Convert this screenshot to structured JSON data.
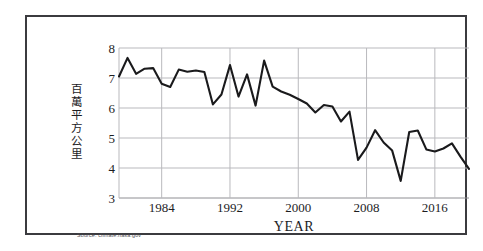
{
  "figure": {
    "source_note": "Source: climate.nasa.gov"
  },
  "chart_data": {
    "type": "line",
    "title": "",
    "xlabel": "YEAR",
    "ylabel": "百萬平方公里",
    "xlim": [
      1979,
      2020
    ],
    "ylim": [
      3,
      8
    ],
    "xticks": [
      1984,
      1992,
      2000,
      2008,
      2016
    ],
    "yticks": [
      3,
      4,
      5,
      6,
      7,
      8
    ],
    "grid": true,
    "legend": "none",
    "series": [
      {
        "name": "Arctic sea ice extent",
        "x": [
          1979,
          1980,
          1981,
          1982,
          1983,
          1984,
          1985,
          1986,
          1987,
          1988,
          1989,
          1990,
          1991,
          1992,
          1993,
          1994,
          1995,
          1996,
          1997,
          1998,
          1999,
          2000,
          2001,
          2002,
          2003,
          2004,
          2005,
          2006,
          2007,
          2008,
          2009,
          2010,
          2011,
          2012,
          2013,
          2014,
          2015,
          2016,
          2017,
          2018,
          2019,
          2020
        ],
        "values": [
          7.05,
          7.67,
          7.14,
          7.31,
          7.33,
          6.81,
          6.7,
          7.28,
          7.21,
          7.25,
          7.2,
          6.12,
          6.45,
          7.43,
          6.38,
          7.12,
          6.08,
          7.58,
          6.71,
          6.55,
          6.44,
          6.3,
          6.15,
          5.85,
          6.1,
          6.05,
          5.55,
          5.88,
          4.27,
          4.68,
          5.26,
          4.85,
          4.58,
          3.57,
          5.2,
          5.25,
          4.62,
          4.55,
          4.65,
          4.82,
          4.38,
          3.97
        ]
      }
    ]
  }
}
